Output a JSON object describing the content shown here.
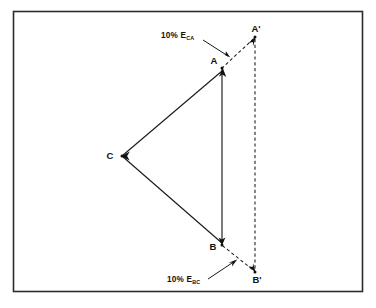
{
  "figure": {
    "background_color": "#ffffff",
    "frame": {
      "name": "outer-border-frame",
      "stroke_color": "#2b2b2b",
      "x": 13.5,
      "y": 11.5,
      "width": 349,
      "height": 280
    },
    "line_color": "#1a1a1a",
    "points": [
      {
        "id": "A",
        "label": "A",
        "x": 222,
        "y": 68,
        "label_x": 214,
        "label_y": 64
      },
      {
        "id": "B",
        "label": "B",
        "x": 222,
        "y": 245,
        "label_x": 213,
        "label_y": 250
      },
      {
        "id": "C",
        "label": "C",
        "x": 122,
        "y": 156,
        "label_x": 110,
        "label_y": 159
      },
      {
        "id": "Ap",
        "label": "A'",
        "x": 255,
        "y": 37,
        "label_x": 256,
        "label_y": 32
      },
      {
        "id": "Bp",
        "label": "B'",
        "x": 255,
        "y": 272,
        "label_x": 257,
        "label_y": 283
      }
    ],
    "solid_edges": [
      {
        "name": "edge-c-to-a",
        "from": "C",
        "to": "A"
      },
      {
        "name": "edge-a-to-b",
        "from": "A",
        "to": "B"
      },
      {
        "name": "edge-c-to-b",
        "from": "C",
        "to": "B"
      }
    ],
    "dashed_edges": [
      {
        "name": "dashed-a-to-aprime",
        "from": "A",
        "to": "Ap"
      },
      {
        "name": "dashed-aprime-to-bprime",
        "from": "Ap",
        "to": "Bp"
      },
      {
        "name": "dashed-b-to-bprime",
        "from": "B",
        "to": "Bp"
      }
    ],
    "annotations": [
      {
        "name": "annotation-ten-percent-eca",
        "prefix": "10% E",
        "subscript": "CA",
        "text_x": 161,
        "text_y": 38,
        "leader_from_x": 203,
        "leader_from_y": 40,
        "leader_to_x": 228,
        "leader_to_y": 56
      },
      {
        "name": "annotation-ten-percent-ebc",
        "prefix": "10% E",
        "subscript": "BC",
        "text_x": 167,
        "text_y": 282,
        "leader_from_x": 208,
        "leader_from_y": 279,
        "leader_to_x": 235,
        "leader_to_y": 261
      }
    ]
  }
}
